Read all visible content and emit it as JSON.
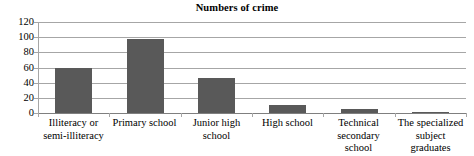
{
  "chart_data": {
    "type": "bar",
    "title": "Numbers of crime",
    "xlabel": "",
    "ylabel": "",
    "ylim": [
      0,
      120
    ],
    "yticks": [
      0,
      20,
      40,
      60,
      80,
      100,
      120
    ],
    "ytick_labels": [
      "0",
      "20",
      "40",
      "60",
      "80",
      "100",
      "120"
    ],
    "grid": true,
    "legend": "none",
    "bar_color": "#595959",
    "categories": [
      "Illiteracy or semi-illiteracy",
      "Primary school",
      "Junior high school",
      "High school",
      "Technical secondary school",
      "The specialized subject graduates"
    ],
    "category_lines": [
      [
        "Illiteracy or",
        "semi-illiteracy"
      ],
      [
        "Primary school",
        ""
      ],
      [
        "Junior high",
        "school"
      ],
      [
        "High school",
        ""
      ],
      [
        "Technical",
        "secondary school"
      ],
      [
        "The specialized",
        "subject graduates"
      ]
    ],
    "values": [
      59,
      97,
      46,
      10,
      5,
      1
    ]
  },
  "axes": {
    "gridline_color": "#a6a6a6",
    "axis_color": "#7f7f7f"
  }
}
